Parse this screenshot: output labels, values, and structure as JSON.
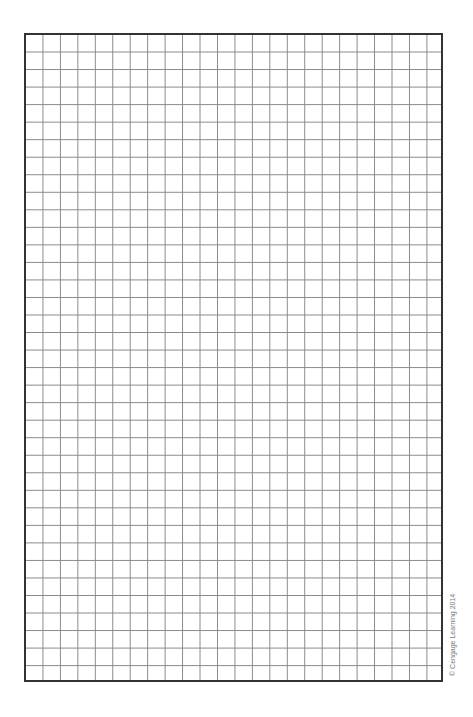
{
  "grid": {
    "columns": 24,
    "rows": 37,
    "line_color": "#888888",
    "border_color": "#333333"
  },
  "credit": "© Cengage Learning 2014"
}
